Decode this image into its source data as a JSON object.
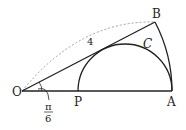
{
  "diagram": {
    "points": {
      "O": {
        "label": "O",
        "x": 22,
        "y": 91
      },
      "A": {
        "label": "A",
        "x": 172,
        "y": 91
      },
      "B": {
        "label": "B",
        "x": 155,
        "y": 22
      },
      "P": {
        "label": "P",
        "x": 78,
        "y": 91
      }
    },
    "curve_label": "C",
    "length_label": "4",
    "angle_label": {
      "numerator": "π",
      "denominator": "6"
    },
    "colors": {
      "stroke": "#222222",
      "dashed": "#888888"
    }
  }
}
